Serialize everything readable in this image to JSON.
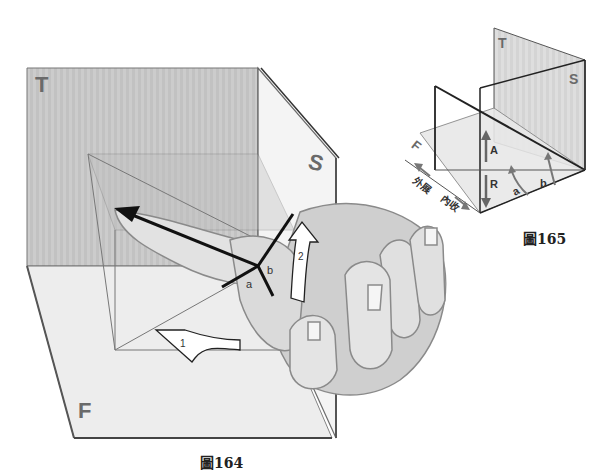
{
  "figure164": {
    "caption": "圖164",
    "planes": {
      "top": "T",
      "side": "S",
      "front": "F"
    },
    "axis_labels": {
      "a": "a",
      "b": "b"
    },
    "arrows": {
      "first": "1",
      "second": "2"
    }
  },
  "figure165": {
    "caption": "圖165",
    "planes": {
      "top": "T",
      "side": "S",
      "front": "F"
    },
    "labels": {
      "A": "A",
      "R": "R",
      "a": "a",
      "b": "b"
    },
    "directions": {
      "abduction": "外展",
      "adduction": "內收"
    }
  },
  "colors": {
    "plane_fill": "#cfcfcf",
    "plane_light": "#ececec",
    "line": "#222222",
    "hand": "#d9d9d9",
    "hand_stroke": "#8a8a8a"
  }
}
